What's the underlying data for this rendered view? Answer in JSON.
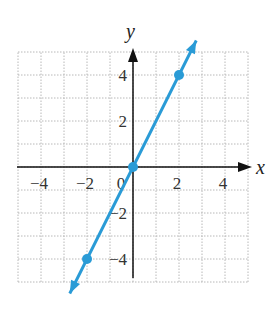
{
  "chart_data": {
    "type": "line",
    "title": "",
    "xlabel": "x",
    "ylabel": "y",
    "xlim": [
      -5,
      5
    ],
    "ylim": [
      -5,
      5
    ],
    "grid": true,
    "x_ticks": [
      -4,
      -2,
      0,
      2,
      4
    ],
    "y_ticks": [
      -4,
      -2,
      2,
      4
    ],
    "x_tick_labels": [
      "−4",
      "−2",
      "0",
      "2",
      "4"
    ],
    "y_tick_labels": [
      "−4",
      "−2",
      "2",
      "4"
    ],
    "series": [
      {
        "name": "y = 2x",
        "equation": "y = 2x",
        "color": "#2a9bd6",
        "points": [
          [
            -2,
            -4
          ],
          [
            0,
            0
          ],
          [
            2,
            4
          ]
        ],
        "arrows_both_ends": true
      }
    ],
    "legend": null
  },
  "colors": {
    "line": "#2a9bd6",
    "grid": "#b8b8b8",
    "axis": "#111111"
  }
}
